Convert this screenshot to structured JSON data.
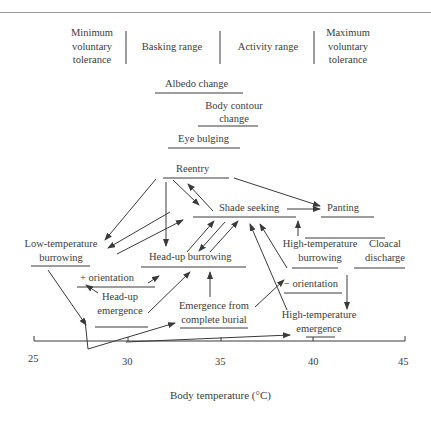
{
  "header": {
    "ranges": [
      {
        "label": "Minimum voluntary tolerance",
        "lines": [
          "Minimum",
          "voluntary",
          "tolerance"
        ]
      },
      {
        "label": "Basking range",
        "lines": [
          "Basking range"
        ]
      },
      {
        "label": "Activity range",
        "lines": [
          "Activity range"
        ]
      },
      {
        "label": "Maximum voluntary tolerance",
        "lines": [
          "Maximum",
          "voluntary",
          "tolerance"
        ]
      }
    ]
  },
  "nodes": {
    "albedo": "Albedo change",
    "body_contour_1": "Body contour",
    "body_contour_2": "change",
    "eye_bulging": "Eye bulging",
    "reentry": "Reentry",
    "shade_seeking": "Shade seeking",
    "panting": "Panting",
    "low_temp_1": "Low-temperature",
    "low_temp_2": "burrowing",
    "headup_burrowing": "Head-up burrowing",
    "plus_orientation": "+ orientation",
    "headup_emergence_1": "Head-up",
    "headup_emergence_2": "emergence",
    "emergence_burial_1": "Emergence from",
    "emergence_burial_2": "complete burial",
    "high_temp_burrow_1": "High-temperature",
    "high_temp_burrow_2": "burrowing",
    "cloacal_1": "Cloacal",
    "cloacal_2": "discharge",
    "minus_orientation": "− orientation",
    "high_temp_emerg_1": "High-temperature",
    "high_temp_emerg_2": "emergence"
  },
  "axis": {
    "label": "Body temperature (°C)",
    "ticks": [
      "25",
      "30",
      "35",
      "40",
      "45"
    ],
    "range": [
      25,
      45
    ]
  }
}
